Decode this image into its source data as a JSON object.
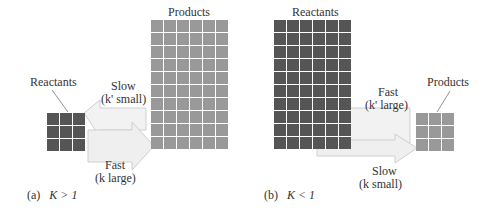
{
  "panels": [
    {
      "id": "a",
      "caption_prefix": "(a)",
      "caption_expr": "K > 1",
      "reactants": {
        "label": "Reactants",
        "rows": 3,
        "cols": 3,
        "color": "#555555"
      },
      "products": {
        "label": "Products",
        "rows": 10,
        "cols": 6,
        "color": "#999999"
      },
      "reverse": {
        "speed": "Slow",
        "rate": "(k' small)"
      },
      "forward": {
        "speed": "Fast",
        "rate": "(k large)"
      }
    },
    {
      "id": "b",
      "caption_prefix": "(b)",
      "caption_expr": "K < 1",
      "reactants": {
        "label": "Reactants",
        "rows": 10,
        "cols": 6,
        "color": "#555555"
      },
      "products": {
        "label": "Products",
        "rows": 3,
        "cols": 3,
        "color": "#999999"
      },
      "reverse": {
        "speed": "Fast",
        "rate": "(k' large)"
      },
      "forward": {
        "speed": "Slow",
        "rate": "(k small)"
      }
    }
  ]
}
